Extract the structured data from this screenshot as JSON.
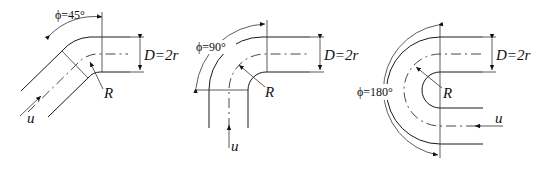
{
  "figure": {
    "panels": [
      {
        "id": "bend-45",
        "angle_label": "ϕ=45°",
        "diameter_label": "D=2r",
        "radius_label": "R",
        "velocity_label": "u"
      },
      {
        "id": "bend-90",
        "angle_label": "ϕ=90°",
        "diameter_label": "D=2r",
        "radius_label": "R",
        "velocity_label": "u"
      },
      {
        "id": "bend-180",
        "angle_label": "ϕ=180°",
        "diameter_label": "D=2r",
        "radius_label": "R",
        "velocity_label": "u"
      }
    ]
  }
}
